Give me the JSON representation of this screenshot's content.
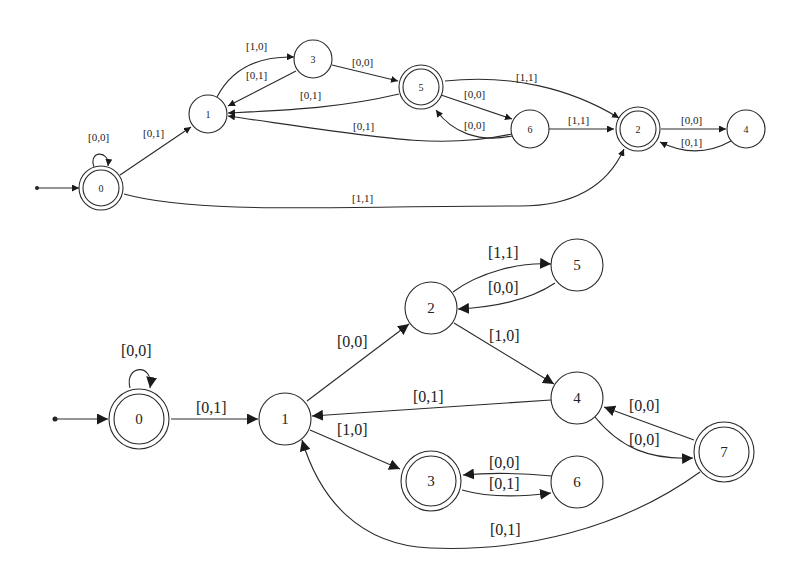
{
  "diagrams": [
    {
      "id": "top",
      "type": "automaton",
      "nodes": [
        {
          "id": "0",
          "label": "0",
          "accepting": true,
          "initial": true
        },
        {
          "id": "1",
          "label": "1",
          "accepting": false
        },
        {
          "id": "3",
          "label": "3",
          "accepting": false
        },
        {
          "id": "5",
          "label": "5",
          "accepting": true
        },
        {
          "id": "6",
          "label": "6",
          "accepting": false
        },
        {
          "id": "2",
          "label": "2",
          "accepting": true
        },
        {
          "id": "4",
          "label": "4",
          "accepting": false
        }
      ],
      "edges": [
        {
          "from": "0",
          "to": "0",
          "label": "[0,0]"
        },
        {
          "from": "0",
          "to": "1",
          "label": "[0,1]"
        },
        {
          "from": "0",
          "to": "2",
          "label": "[1,1]"
        },
        {
          "from": "1",
          "to": "3",
          "label": "[1,0]"
        },
        {
          "from": "3",
          "to": "1",
          "label": "[0,1]"
        },
        {
          "from": "3",
          "to": "5",
          "label": "[0,0]"
        },
        {
          "from": "5",
          "to": "1",
          "label": "[0,1]"
        },
        {
          "from": "5",
          "to": "6",
          "label": "[0,0]"
        },
        {
          "from": "5",
          "to": "2",
          "label": "[1,1]"
        },
        {
          "from": "6",
          "to": "5",
          "label": "[0,0]"
        },
        {
          "from": "6",
          "to": "1",
          "label": "[0,1]"
        },
        {
          "from": "6",
          "to": "2",
          "label": "[1,1]"
        },
        {
          "from": "2",
          "to": "4",
          "label": "[0,0]"
        },
        {
          "from": "4",
          "to": "2",
          "label": "[0,1]"
        }
      ]
    },
    {
      "id": "bottom",
      "type": "automaton",
      "nodes": [
        {
          "id": "0",
          "label": "0",
          "accepting": true,
          "initial": true
        },
        {
          "id": "1",
          "label": "1",
          "accepting": false
        },
        {
          "id": "2",
          "label": "2",
          "accepting": false
        },
        {
          "id": "5",
          "label": "5",
          "accepting": false
        },
        {
          "id": "4",
          "label": "4",
          "accepting": false
        },
        {
          "id": "7",
          "label": "7",
          "accepting": true
        },
        {
          "id": "3",
          "label": "3",
          "accepting": true
        },
        {
          "id": "6",
          "label": "6",
          "accepting": false
        }
      ],
      "edges": [
        {
          "from": "0",
          "to": "0",
          "label": "[0,0]"
        },
        {
          "from": "0",
          "to": "1",
          "label": "[0,1]"
        },
        {
          "from": "1",
          "to": "2",
          "label": "[0,0]"
        },
        {
          "from": "1",
          "to": "3",
          "label": "[1,0]"
        },
        {
          "from": "2",
          "to": "5",
          "label": "[1,1]"
        },
        {
          "from": "5",
          "to": "2",
          "label": "[0,0]"
        },
        {
          "from": "2",
          "to": "4",
          "label": "[1,0]"
        },
        {
          "from": "4",
          "to": "1",
          "label": "[0,1]"
        },
        {
          "from": "4",
          "to": "7",
          "label": "[0,0]"
        },
        {
          "from": "7",
          "to": "4",
          "label": "[0,0]"
        },
        {
          "from": "7",
          "to": "1",
          "label": "[0,1]"
        },
        {
          "from": "6",
          "to": "3",
          "label": "[0,0]"
        },
        {
          "from": "3",
          "to": "6",
          "label": "[0,1]"
        }
      ]
    }
  ]
}
